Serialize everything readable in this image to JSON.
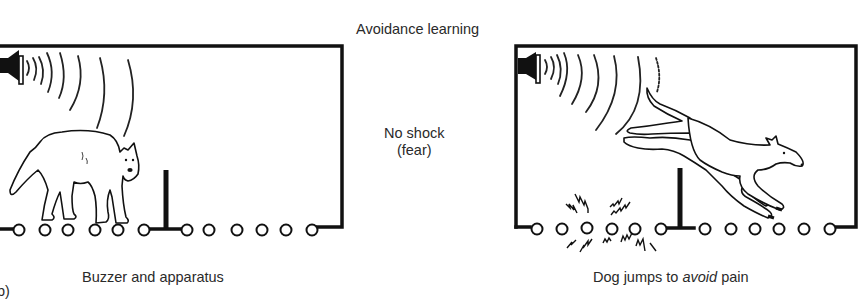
{
  "figure": {
    "title": "Avoidance learning",
    "panel_tag": "b)",
    "center_note": {
      "line1": "No shock",
      "line2": "(fear)"
    },
    "left_panel": {
      "caption": "Buzzer and apparatus",
      "elements": [
        "buzzer-speaker",
        "sound-waves",
        "standing-dog",
        "barrier",
        "grid-floor"
      ]
    },
    "right_panel": {
      "caption_prefix": "Dog jumps to ",
      "caption_emphasis": "avoid",
      "caption_suffix": " pain",
      "elements": [
        "buzzer-speaker",
        "sound-waves",
        "jumping-dog",
        "barrier",
        "electric-sparks",
        "grid-floor"
      ]
    }
  }
}
